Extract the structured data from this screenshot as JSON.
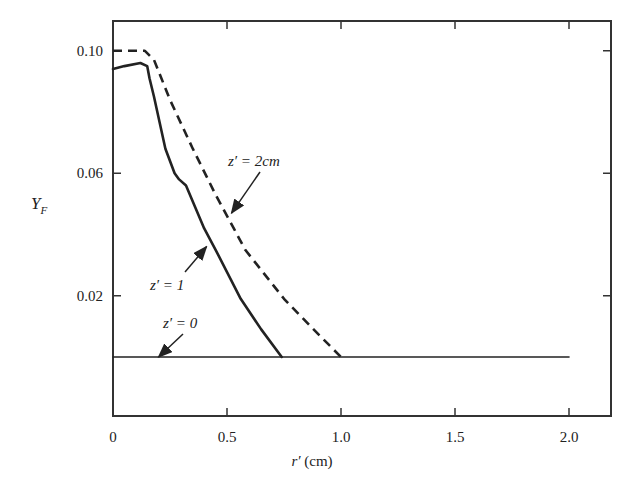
{
  "chart_data": {
    "type": "line",
    "title": "",
    "xlabel": "r′ (cm)",
    "ylabel": "Y_F",
    "xlim": [
      0,
      2.2
    ],
    "ylim": [
      -0.018,
      0.112
    ],
    "grid": false,
    "legend": "none (curves labeled by annotations with arrows)",
    "x_ticks": [
      0,
      0.5,
      1.0,
      1.5,
      2.0
    ],
    "x_tick_labels": [
      "0",
      "0.5",
      "1.0",
      "1.5",
      "2.0"
    ],
    "y_ticks": [
      0.02,
      0.06,
      0.1
    ],
    "y_tick_labels": [
      "0.02",
      "0.06",
      "0.10"
    ],
    "series": [
      {
        "name": "z′ = 0",
        "style": "solid thin",
        "x": [
          0,
          2.0
        ],
        "y": [
          0.0,
          0.0
        ]
      },
      {
        "name": "z′ = 1",
        "style": "solid thick",
        "x": [
          0,
          0.05,
          0.12,
          0.15,
          0.16,
          0.18,
          0.23,
          0.27,
          0.29,
          0.32,
          0.4,
          0.45,
          0.56,
          0.65,
          0.74
        ],
        "y": [
          0.094,
          0.095,
          0.096,
          0.095,
          0.091,
          0.085,
          0.068,
          0.06,
          0.058,
          0.056,
          0.042,
          0.035,
          0.019,
          0.009,
          0.0
        ]
      },
      {
        "name": "z′ = 2cm",
        "style": "dashed thick",
        "x": [
          0,
          0.08,
          0.14,
          0.18,
          0.25,
          0.35,
          0.45,
          0.53,
          0.58,
          0.75,
          0.88,
          1.0
        ],
        "y": [
          0.1,
          0.1,
          0.1,
          0.097,
          0.084,
          0.068,
          0.053,
          0.042,
          0.035,
          0.019,
          0.009,
          0.0
        ]
      }
    ],
    "annotations": [
      {
        "text": "z′ = 2cm",
        "arrow_to": {
          "x": 0.52,
          "y": 0.047
        }
      },
      {
        "text": "z′ = 1",
        "arrow_to": {
          "x": 0.41,
          "y": 0.036
        }
      },
      {
        "text": "z′ = 0",
        "arrow_to": {
          "x": 0.2,
          "y": 0.0
        }
      }
    ]
  },
  "labels": {
    "xlabel_var": "r′",
    "xlabel_unit": "(cm)",
    "ylabel_main": "Y",
    "ylabel_sub": "F",
    "ann_z2": "z′ = 2cm",
    "ann_z1": "z′ = 1",
    "ann_z0": "z′ = 0"
  }
}
